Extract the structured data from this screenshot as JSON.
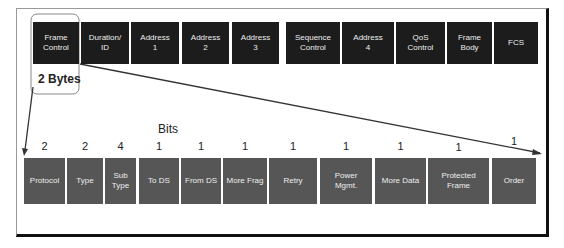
{
  "diagram": {
    "top_fields": [
      {
        "label": "Frame\nControl",
        "x": 33,
        "w": 46
      },
      {
        "label": "Duration/\nID",
        "x": 81,
        "w": 48
      },
      {
        "label": "Address\n1",
        "x": 131,
        "w": 48
      },
      {
        "label": "Address\n2",
        "x": 182,
        "w": 47
      },
      {
        "label": "Address\n3",
        "x": 232,
        "w": 47
      },
      {
        "label": "Sequence\nControl",
        "x": 286,
        "w": 54
      },
      {
        "label": "Address\n4",
        "x": 342,
        "w": 52
      },
      {
        "label": "QoS\nControl",
        "x": 396,
        "w": 49
      },
      {
        "label": "Frame\nBody",
        "x": 447,
        "w": 45
      },
      {
        "label": "FCS",
        "x": 494,
        "w": 44
      }
    ],
    "bytes_label": "2 Bytes",
    "bits_label": "Bits",
    "bit_fields": [
      {
        "label": "Protocol",
        "bits": "2"
      },
      {
        "label": "Type",
        "bits": "2"
      },
      {
        "label": "Sub\nType",
        "bits": "4"
      },
      {
        "label": "To DS",
        "bits": "1"
      },
      {
        "label": "From DS",
        "bits": "1"
      },
      {
        "label": "More Frag",
        "bits": "1"
      },
      {
        "label": "Retry",
        "bits": "1"
      },
      {
        "label": "Power\nMgmt.",
        "bits": "1"
      },
      {
        "label": "More Data",
        "bits": "1"
      },
      {
        "label": "Protected\nFrame",
        "bits": "1"
      },
      {
        "label": "Order",
        "bits": "1"
      }
    ],
    "colors": {
      "top_box": "#1c1c1c",
      "bottom_box": "#565656",
      "text": "#eeeeee"
    }
  }
}
